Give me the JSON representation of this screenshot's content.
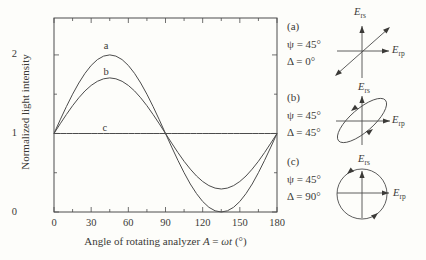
{
  "figure": {
    "background": "#fdfdfa",
    "ink": "#3b3a37",
    "line_color": "#4c4c4c"
  },
  "chart_data": {
    "type": "line",
    "title": "",
    "ylabel": "Normalized light intensity",
    "xlabel_parts": {
      "prefix": "Angle of rotating analyzer ",
      "var1": "A",
      "eq": " = ",
      "var2": "ωt",
      "suffix": " (°)"
    },
    "xlim": [
      0,
      180
    ],
    "ylim": [
      0,
      2.47
    ],
    "grid": false,
    "frame": "box-mirrored-ticks",
    "x_major_ticks": [
      0,
      30,
      60,
      90,
      120,
      150,
      180
    ],
    "x_minor_ticks": [
      15,
      45,
      75,
      105,
      135,
      165
    ],
    "y_major_ticks": [
      0,
      1,
      2
    ],
    "y_minor_ticks": [
      0.5,
      1.5
    ],
    "x_deg": [
      0,
      5,
      10,
      15,
      20,
      25,
      30,
      35,
      40,
      45,
      50,
      55,
      60,
      65,
      70,
      75,
      80,
      85,
      90,
      95,
      100,
      105,
      110,
      115,
      120,
      125,
      130,
      135,
      140,
      145,
      150,
      155,
      160,
      165,
      170,
      175,
      180
    ],
    "series": [
      {
        "label": "a",
        "psi_deg": 45,
        "delta_deg": 0,
        "values": [
          1,
          1.174,
          1.342,
          1.5,
          1.643,
          1.766,
          1.866,
          1.94,
          1.985,
          2,
          1.985,
          1.94,
          1.866,
          1.766,
          1.643,
          1.5,
          1.342,
          1.174,
          1,
          0.826,
          0.658,
          0.5,
          0.357,
          0.234,
          0.134,
          0.06,
          0.015,
          0,
          0.015,
          0.06,
          0.134,
          0.234,
          0.357,
          0.5,
          0.658,
          0.826,
          1
        ],
        "label_x_deg": 42,
        "label_y": 2.13
      },
      {
        "label": "b",
        "psi_deg": 45,
        "delta_deg": 45,
        "values": [
          1,
          1.123,
          1.242,
          1.354,
          1.454,
          1.542,
          1.612,
          1.664,
          1.696,
          1.707,
          1.696,
          1.664,
          1.612,
          1.542,
          1.454,
          1.354,
          1.242,
          1.123,
          1,
          0.877,
          0.758,
          0.646,
          0.546,
          0.458,
          0.388,
          0.336,
          0.304,
          0.293,
          0.304,
          0.336,
          0.388,
          0.458,
          0.546,
          0.646,
          0.758,
          0.877,
          1
        ],
        "label_x_deg": 42,
        "label_y": 1.8
      },
      {
        "label": "c",
        "psi_deg": 45,
        "delta_deg": 90,
        "values": [
          1,
          1,
          1,
          1,
          1,
          1,
          1,
          1,
          1,
          1,
          1,
          1,
          1,
          1,
          1,
          1,
          1,
          1,
          1,
          1,
          1,
          1,
          1,
          1,
          1,
          1,
          1,
          1,
          1,
          1,
          1,
          1,
          1,
          1,
          1,
          1,
          1
        ],
        "label_x_deg": 41,
        "label_y": 1.08
      }
    ]
  },
  "annotations": [
    {
      "tag": "(a)",
      "psi": "ψ = 45°",
      "delta": "Δ = 0°"
    },
    {
      "tag": "(b)",
      "psi": "ψ = 45°",
      "delta": "Δ = 45°"
    },
    {
      "tag": "(c)",
      "psi": "ψ = 45°",
      "delta": "Δ = 90°"
    }
  ],
  "diagrams": {
    "a": {
      "type": "linear-polarization",
      "vaxis_label": {
        "base": "E",
        "sub": "rs"
      },
      "haxis_label": {
        "base": "E",
        "sub": "rp"
      }
    },
    "b": {
      "type": "elliptical-polarization",
      "vaxis_label": {
        "base": "E",
        "sub": "rs"
      },
      "haxis_label": {
        "base": "E",
        "sub": "rp"
      }
    },
    "c": {
      "type": "circular-polarization",
      "vaxis_label": {
        "base": "E",
        "sub": "rs"
      },
      "haxis_label": {
        "base": "E",
        "sub": "rp"
      }
    }
  }
}
